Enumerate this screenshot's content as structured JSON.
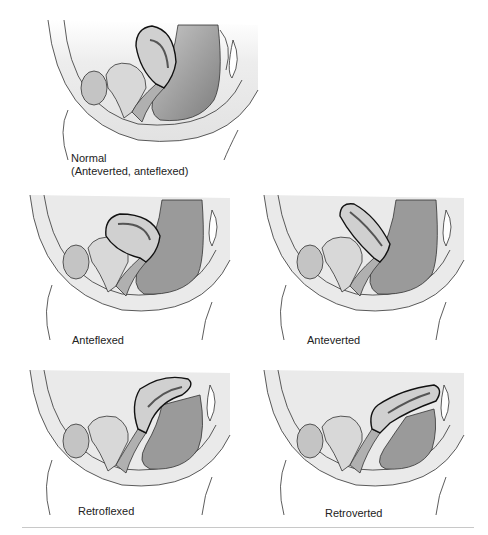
{
  "figure": {
    "panels": [
      {
        "id": "normal",
        "label_line1": "Normal",
        "label_line2": "(Anteverted, anteflexed)",
        "variant": "normal"
      },
      {
        "id": "anteflexed",
        "label_line1": "Anteflexed",
        "variant": "anteflexed"
      },
      {
        "id": "anteverted",
        "label_line1": "Anteverted",
        "variant": "anteverted"
      },
      {
        "id": "retroflexed",
        "label_line1": "Retroflexed",
        "variant": "retroflexed"
      },
      {
        "id": "retroverted",
        "label_line1": "Retroverted",
        "variant": "retroverted"
      }
    ],
    "colors": {
      "outline": "#1e1e1e",
      "tissue_light": "#e6e6e6",
      "tissue_mid": "#c4c4c4",
      "tissue_dark": "#8f8f8f",
      "background": "#ffffff",
      "divider": "#c8c8c8"
    }
  }
}
